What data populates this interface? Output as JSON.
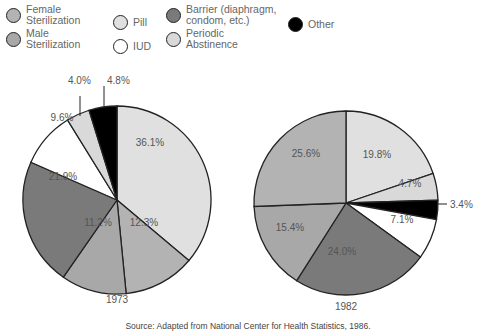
{
  "chart_data": [
    {
      "type": "pie",
      "title": "1973",
      "categories": [
        "Pill",
        "Female Sterilization",
        "Male Sterilization",
        "Barrier (diaphragm, condom, etc.)",
        "IUD",
        "Periodic Abstinence",
        "Other"
      ],
      "values": [
        36.1,
        12.3,
        11.2,
        21.9,
        9.6,
        4.0,
        4.8
      ],
      "labels": [
        "36.1%",
        "12.3%",
        "11.2%",
        "21.9%",
        "9.6%",
        "4.0%",
        "4.8%"
      ]
    },
    {
      "type": "pie",
      "title": "1982",
      "categories": [
        "Pill",
        "Periodic Abstinence",
        "Other",
        "IUD",
        "Barrier (diaphragm, condom, etc.)",
        "Male Sterilization",
        "Female Sterilization"
      ],
      "values": [
        19.8,
        4.7,
        3.4,
        7.1,
        24.0,
        15.4,
        25.6
      ],
      "labels": [
        "19.8%",
        "4.7%",
        "3.4%",
        "7.1%",
        "24.0%",
        "15.4%",
        "25.6%"
      ]
    }
  ],
  "legend": [
    {
      "line1": "Female",
      "line2": "Sterilization",
      "color": "#b3b3b3"
    },
    {
      "line1": "Male",
      "line2": "Sterilization",
      "color": "#a8a8a8"
    },
    {
      "line1": "Pill",
      "line2": "",
      "color": "#e0e0e0"
    },
    {
      "line1": "IUD",
      "line2": "",
      "color": "#ffffff"
    },
    {
      "line1": "Barrier (diaphragm,",
      "line2": "condom, etc.)",
      "color": "#7a7a7a"
    },
    {
      "line1": "Periodic",
      "line2": "Abstinence",
      "color": "#d9d9d9"
    },
    {
      "line1": "Other",
      "line2": "",
      "color": "#000000"
    }
  ],
  "colors": {
    "Pill": "#e0e0e0",
    "Female Sterilization": "#b3b3b3",
    "Male Sterilization": "#a8a8a8",
    "Barrier (diaphragm, condom, etc.)": "#7a7a7a",
    "IUD": "#ffffff",
    "Periodic Abstinence": "#d9d9d9",
    "Other": "#000000"
  },
  "source": "Source: Adapted from National Center for Health Statistics, 1986."
}
